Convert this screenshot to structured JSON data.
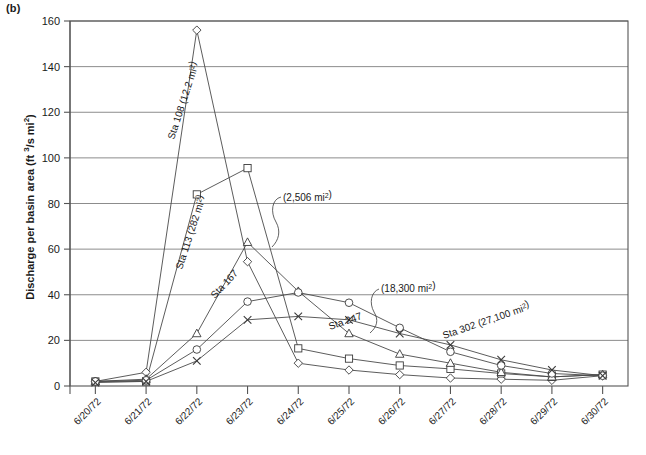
{
  "figure": {
    "panel_label": "(b)"
  },
  "chart_data": {
    "type": "line",
    "title": "",
    "xlabel": "",
    "ylabel": "Discharge per basin area (ft 3/s mi2)",
    "ylabel_parts": {
      "prefix": "Discharge per basin area (ft ",
      "sup1": "3",
      "mid": "/s mi",
      "sup2": "2",
      "suffix": ")"
    },
    "categories": [
      "6/20/72",
      "6/21/72",
      "6/22/72",
      "6/23/72",
      "6/24/72",
      "6/25/72",
      "6/26/72",
      "6/27/72",
      "6/28/72",
      "6/29/72",
      "6/30/72"
    ],
    "ylim": [
      0,
      160
    ],
    "yticks": [
      0,
      20,
      40,
      60,
      80,
      100,
      120,
      140,
      160
    ],
    "grid": true,
    "legend": "none",
    "series": [
      {
        "name": "Sta 108",
        "label": "Sta 108 (12.2 mi2)",
        "label_text": "Sta 108 (12.2 mi",
        "label_sup": "2",
        "label_tail": ")",
        "area": "12.2 mi2",
        "marker": "diamond",
        "values": [
          2.0,
          6.0,
          156.0,
          54.5,
          10.0,
          7.0,
          5.0,
          3.5,
          3.0,
          2.5,
          4.5
        ]
      },
      {
        "name": "Sta 113",
        "label": "Sta 113 (282 mi2)",
        "label_text": "Sta 113 (282 mi",
        "label_sup": "2",
        "label_tail": ")",
        "area": "282 mi2",
        "marker": "square",
        "values": [
          2.0,
          2.0,
          84.0,
          95.5,
          16.5,
          12.0,
          9.0,
          7.5,
          5.5,
          4.0,
          5.0
        ]
      },
      {
        "name": "Sta 167",
        "label": "Sta 167",
        "area": "2,506 mi2",
        "annotation": "(2,506 mi2)",
        "annotation_text": "(2,506 mi",
        "annotation_sup": "2",
        "annotation_tail": ")",
        "marker": "triangle",
        "values": [
          2.0,
          3.0,
          23.0,
          63.0,
          41.5,
          23.0,
          14.0,
          10.0,
          6.0,
          4.0,
          5.0
        ]
      },
      {
        "name": "Sta 247",
        "label": "Sta 247",
        "area": "18,300 mi2",
        "annotation": "(18,300 mi2)",
        "annotation_text": "(18,300 mi",
        "annotation_sup": "2",
        "annotation_tail": ")",
        "marker": "circle",
        "values": [
          2.0,
          2.5,
          16.0,
          37.0,
          41.0,
          36.5,
          25.5,
          15.0,
          9.0,
          5.5,
          4.5
        ]
      },
      {
        "name": "Sta 302",
        "label": "Sta 302 (27,100 mi2)",
        "label_text": "Sta 302 (27,100 mi",
        "label_sup": "2",
        "label_tail": ")",
        "area": "27,100 mi2",
        "marker": "cross",
        "values": [
          1.5,
          2.0,
          11.0,
          29.0,
          30.5,
          29.0,
          23.0,
          18.0,
          11.5,
          7.0,
          4.5
        ]
      }
    ]
  }
}
